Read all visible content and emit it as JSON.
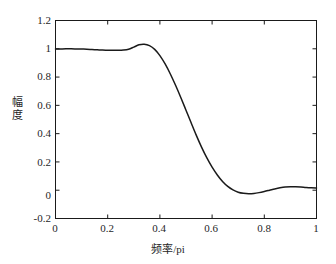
{
  "figure": {
    "background_color": "#ffffff",
    "axis_color": "#1a1a1a",
    "curve_color": "#1a1a1a"
  },
  "axes": {
    "x_ticks": [
      "0",
      "0.2",
      "0.4",
      "0.6",
      "0.8",
      "1"
    ],
    "y_ticks": [
      "-0.2",
      "0",
      "0.2",
      "0.4",
      "0.6",
      "0.8",
      "1",
      "1.2"
    ],
    "xlabel": "频率/pi",
    "ylabel_chars": [
      "幅",
      "度"
    ]
  },
  "chart_data": {
    "type": "line",
    "title": "",
    "xlabel": "频率/pi",
    "ylabel": "幅度",
    "xlim": [
      0,
      1
    ],
    "ylim": [
      -0.2,
      1.2
    ],
    "xticks": [
      0,
      0.2,
      0.4,
      0.6,
      0.8,
      1
    ],
    "yticks": [
      -0.2,
      0,
      0.2,
      0.4,
      0.6,
      0.8,
      1,
      1.2
    ],
    "grid": false,
    "legend": null,
    "series": [
      {
        "name": "幅度响应",
        "color": "#1a1a1a",
        "x": [
          0.0,
          0.02,
          0.04,
          0.06,
          0.08,
          0.1,
          0.12,
          0.14,
          0.16,
          0.18,
          0.2,
          0.22,
          0.24,
          0.26,
          0.28,
          0.3,
          0.32,
          0.34,
          0.36,
          0.38,
          0.4,
          0.42,
          0.44,
          0.46,
          0.48,
          0.5,
          0.52,
          0.54,
          0.56,
          0.58,
          0.6,
          0.62,
          0.64,
          0.66,
          0.68,
          0.7,
          0.72,
          0.74,
          0.76,
          0.78,
          0.8,
          0.82,
          0.84,
          0.86,
          0.88,
          0.9,
          0.92,
          0.94,
          0.96,
          0.98,
          1.0
        ],
        "y": [
          0.998,
          0.999,
          1.0,
          1.0,
          0.999,
          0.998,
          0.997,
          0.995,
          0.993,
          0.991,
          0.99,
          0.989,
          0.989,
          0.991,
          0.997,
          1.012,
          1.028,
          1.032,
          1.022,
          0.996,
          0.952,
          0.893,
          0.822,
          0.742,
          0.656,
          0.566,
          0.475,
          0.386,
          0.303,
          0.228,
          0.163,
          0.108,
          0.062,
          0.027,
          0.002,
          -0.014,
          -0.022,
          -0.025,
          -0.023,
          -0.017,
          -0.009,
          0.0,
          0.009,
          0.017,
          0.023,
          0.025,
          0.024,
          0.022,
          0.019,
          0.017,
          0.016
        ]
      }
    ]
  }
}
